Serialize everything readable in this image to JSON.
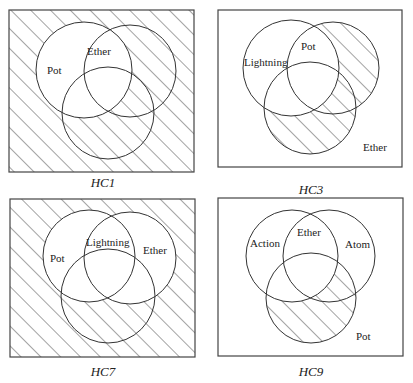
{
  "diagrams": [
    {
      "id": "HC1",
      "caption": "HC1",
      "box": {
        "x": 9,
        "y": 10,
        "w": 185,
        "h": 162
      },
      "circles": [
        {
          "name": "Pot",
          "cx": 84,
          "cy": 70,
          "r": 48
        },
        {
          "name": "Ether",
          "cx": 130,
          "cy": 71,
          "r": 46
        },
        {
          "name": "unlabeled",
          "cx": 108,
          "cy": 113,
          "r": 46
        }
      ],
      "labels": [
        {
          "text": "Pot",
          "x": 47,
          "y": 74
        },
        {
          "text": "Ether",
          "x": 87,
          "y": 55
        }
      ],
      "shading": "outside Pot",
      "caption_pos": {
        "x": 103,
        "y": 187
      }
    },
    {
      "id": "HC3",
      "caption": "HC3",
      "box": {
        "x": 218,
        "y": 10,
        "w": 184,
        "h": 157
      },
      "circles": [
        {
          "name": "Lightning",
          "cx": 291,
          "cy": 68,
          "r": 48
        },
        {
          "name": "Pot",
          "cx": 333,
          "cy": 68,
          "r": 46
        },
        {
          "name": "Ether",
          "cx": 310,
          "cy": 108,
          "r": 46
        }
      ],
      "labels": [
        {
          "text": "Lightning",
          "x": 244,
          "y": 66
        },
        {
          "text": "Pot",
          "x": 301,
          "y": 50
        },
        {
          "text": "Ether",
          "x": 363,
          "y": 151
        }
      ],
      "shading": "(Pot ∪ Ether) minus Lightning",
      "caption_pos": {
        "x": 311,
        "y": 194
      }
    },
    {
      "id": "HC7",
      "caption": "HC7",
      "box": {
        "x": 10,
        "y": 199,
        "w": 185,
        "h": 158
      },
      "circles": [
        {
          "name": "Pot",
          "cx": 89,
          "cy": 256,
          "r": 46
        },
        {
          "name": "Ether",
          "cx": 130,
          "cy": 258,
          "r": 46
        },
        {
          "name": "unlabeled",
          "cx": 108,
          "cy": 296,
          "r": 47
        }
      ],
      "labels": [
        {
          "text": "Pot",
          "x": 50,
          "y": 262
        },
        {
          "text": "Lightning",
          "x": 86,
          "y": 246
        },
        {
          "text": "Ether",
          "x": 143,
          "y": 254
        }
      ],
      "shading": "outside Pot ∪ Ether",
      "caption_pos": {
        "x": 103,
        "y": 376
      }
    },
    {
      "id": "HC9",
      "caption": "HC9",
      "box": {
        "x": 218,
        "y": 198,
        "w": 185,
        "h": 158
      },
      "circles": [
        {
          "name": "Action",
          "cx": 292,
          "cy": 256,
          "r": 46
        },
        {
          "name": "Atom",
          "cx": 329,
          "cy": 256,
          "r": 46
        },
        {
          "name": "Pot",
          "cx": 311,
          "cy": 298,
          "r": 45
        }
      ],
      "labels": [
        {
          "text": "Action",
          "x": 250,
          "y": 247
        },
        {
          "text": "Ether",
          "x": 297,
          "y": 236
        },
        {
          "text": "Atom",
          "x": 345,
          "y": 248
        },
        {
          "text": "Pot",
          "x": 356,
          "y": 340
        }
      ],
      "shading": "Pot minus Action",
      "caption_pos": {
        "x": 311,
        "y": 376
      }
    }
  ]
}
